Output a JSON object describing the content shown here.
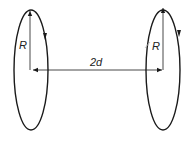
{
  "diagram": {
    "labels": {
      "left_radius": "R",
      "right_radius": "R",
      "separation": "2d"
    },
    "loops": [
      {
        "name": "left-loop",
        "center": [
          31,
          70
        ],
        "rx": 17,
        "ry": 60,
        "current_direction": "down on right side"
      },
      {
        "name": "right-loop",
        "center": [
          163,
          70
        ],
        "rx": 17,
        "ry": 60,
        "current_direction": "down on right side"
      }
    ],
    "colors": {
      "stroke": "#1a1a1a",
      "background": "#ffffff"
    }
  }
}
